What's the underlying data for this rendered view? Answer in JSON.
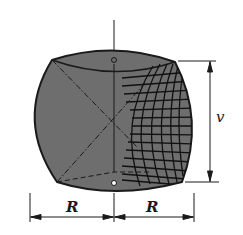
{
  "diagram": {
    "colors": {
      "body_fill": "#6e6e6e",
      "outline": "#1a1a1a",
      "grid": "#111111",
      "background": "#ffffff"
    },
    "labels": {
      "height_label": "v",
      "left_radius_label": "R",
      "right_radius_label": "R"
    },
    "dimensions": [
      {
        "name": "height",
        "label": "v",
        "orientation": "vertical"
      },
      {
        "name": "left-radius",
        "label": "R",
        "orientation": "horizontal"
      },
      {
        "name": "right-radius",
        "label": "R",
        "orientation": "horizontal"
      }
    ]
  }
}
